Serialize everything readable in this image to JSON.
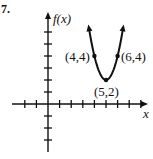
{
  "problem_number": "7.",
  "chart_data": {
    "type": "line",
    "title": "",
    "xlabel": "x",
    "ylabel": "f(x)",
    "function": "parabola opening upward",
    "vertex": [
      5,
      2
    ],
    "labeled_points": [
      {
        "label": "(4,4)",
        "x": 4,
        "y": 4
      },
      {
        "label": "(5,2)",
        "x": 5,
        "y": 2
      },
      {
        "label": "(6,4)",
        "x": 6,
        "y": 4
      }
    ],
    "xlim": [
      -2,
      8
    ],
    "ylim": [
      -4,
      7
    ],
    "x_ticks": [
      -2,
      -1,
      1,
      2,
      3,
      4,
      5,
      6,
      7,
      8
    ],
    "y_ticks": [
      -3,
      -2,
      -1,
      1,
      2,
      3,
      4,
      5,
      6,
      7
    ],
    "grid": false,
    "arrows_on_curve_ends": true
  }
}
